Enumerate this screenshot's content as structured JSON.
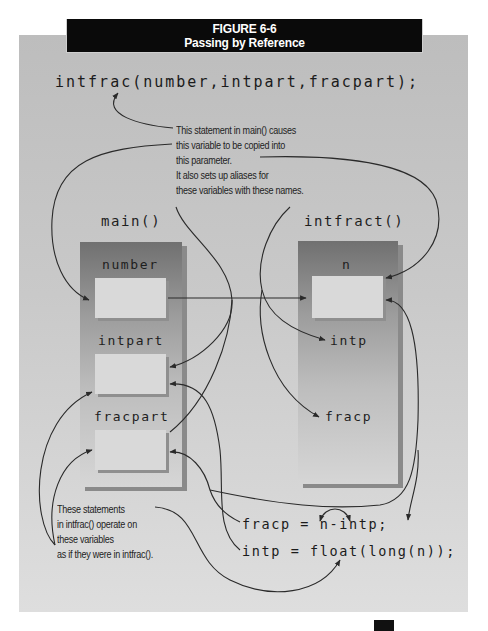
{
  "figure": {
    "number": "FIGURE 6-6",
    "title": "Passing by Reference"
  },
  "call_statement": "intfrac(number,intpart,fracpart);",
  "annotations": {
    "top_note": [
      "This statement in main() causes",
      "this variable to be copied into",
      "this parameter.",
      "It also sets up aliases for",
      "these variables with these names."
    ],
    "bottom_note": [
      "These statements",
      "in intfrac() operate on",
      "these variables",
      "as if they were in intfrac()."
    ]
  },
  "main_block": {
    "title": "main()",
    "variables": [
      "number",
      "intpart",
      "fracpart"
    ]
  },
  "function_block": {
    "title": "intfract()",
    "parameters": [
      "n",
      "intp",
      "fracp"
    ]
  },
  "body_statements": [
    "fracp = n-intp;",
    "intp = float(long(n));"
  ],
  "colors": {
    "header_bg": "#0a0a0a",
    "panel_bg": "#c9c9c9",
    "block_top": "#707070",
    "block_bottom": "#d6d6d6",
    "slot_bg": "#d9d9d9",
    "arrow": "#2a2a2a"
  }
}
